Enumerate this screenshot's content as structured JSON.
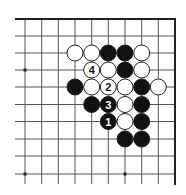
{
  "diagram": {
    "type": "go-board-problem",
    "grid": {
      "cols_x": [
        25,
        41.7,
        58.3,
        75,
        91.7,
        108.3,
        125,
        141.7,
        158.3,
        175
      ],
      "rows_y": [
        19,
        36,
        53,
        70,
        87,
        104.5,
        121.5,
        139,
        156,
        174
      ],
      "line_start_x": 15,
      "line_end_y": 184,
      "edges": [
        "top",
        "right"
      ]
    },
    "star_points": [
      {
        "col": 0,
        "row": 3
      },
      {
        "col": 0,
        "row": 9
      },
      {
        "col": 6,
        "row": 9
      }
    ],
    "stones": [
      {
        "col": 3,
        "row": 2,
        "color": "white",
        "label": ""
      },
      {
        "col": 4,
        "row": 2,
        "color": "white",
        "label": ""
      },
      {
        "col": 5,
        "row": 2,
        "color": "black",
        "label": ""
      },
      {
        "col": 6,
        "row": 2,
        "color": "black",
        "label": ""
      },
      {
        "col": 7,
        "row": 2,
        "color": "white",
        "label": ""
      },
      {
        "col": 4,
        "row": 3,
        "color": "white",
        "label": "4"
      },
      {
        "col": 5,
        "row": 3,
        "color": "white",
        "label": ""
      },
      {
        "col": 6,
        "row": 3,
        "color": "black",
        "label": ""
      },
      {
        "col": 7,
        "row": 3,
        "color": "white",
        "label": ""
      },
      {
        "col": 3,
        "row": 4,
        "color": "black",
        "label": ""
      },
      {
        "col": 4,
        "row": 4,
        "color": "white",
        "label": ""
      },
      {
        "col": 5,
        "row": 4,
        "color": "white",
        "label": "2"
      },
      {
        "col": 6,
        "row": 4,
        "color": "white",
        "label": ""
      },
      {
        "col": 7,
        "row": 4,
        "color": "black",
        "label": ""
      },
      {
        "col": 8,
        "row": 4,
        "color": "white",
        "label": ""
      },
      {
        "col": 4,
        "row": 5,
        "color": "black",
        "label": ""
      },
      {
        "col": 5,
        "row": 5,
        "color": "black",
        "label": "3"
      },
      {
        "col": 6,
        "row": 5,
        "color": "white",
        "label": ""
      },
      {
        "col": 7,
        "row": 5,
        "color": "black",
        "label": ""
      },
      {
        "col": 5,
        "row": 6,
        "color": "black",
        "label": "1"
      },
      {
        "col": 6,
        "row": 6,
        "color": "white",
        "label": ""
      },
      {
        "col": 7,
        "row": 6,
        "color": "black",
        "label": ""
      },
      {
        "col": 6,
        "row": 7,
        "color": "black",
        "label": ""
      },
      {
        "col": 7,
        "row": 7,
        "color": "black",
        "label": ""
      }
    ],
    "colors": {
      "line": "#555555",
      "edge": "#222222",
      "black_stone": "#111111",
      "white_stone": "#ffffff",
      "stone_outline": "#222222",
      "background": "#ffffff"
    }
  }
}
